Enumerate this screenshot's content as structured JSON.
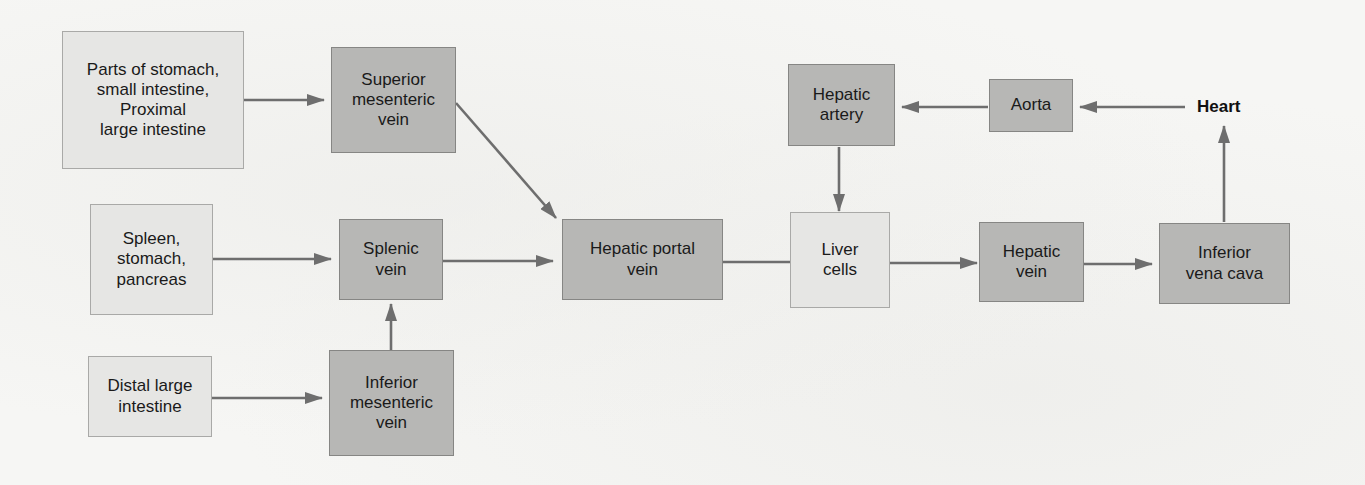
{
  "diagram": {
    "colors": {
      "background": "#f6f6f4",
      "source_box": "#e6e6e4",
      "vessel_box": "#b7b7b5",
      "arrow": "#6e6e6e",
      "text": "#1a1a1a"
    },
    "nodes": {
      "parts_of_stomach": {
        "label": "Parts of stomach,\nsmall intestine,\nProximal\nlarge intestine",
        "style": "light"
      },
      "superior_mesenteric_vein": {
        "label": "Superior\nmesenteric\nvein",
        "style": "dark"
      },
      "spleen_stomach_pancreas": {
        "label": "Spleen,\nstomach,\npancreas",
        "style": "light"
      },
      "splenic_vein": {
        "label": "Splenic\nvein",
        "style": "dark"
      },
      "distal_large_intestine": {
        "label": "Distal large\nintestine",
        "style": "light"
      },
      "inferior_mesenteric_vein": {
        "label": "Inferior\nmesenteric\nvein",
        "style": "dark"
      },
      "hepatic_portal_vein": {
        "label": "Hepatic portal\nvein",
        "style": "dark"
      },
      "liver_cells": {
        "label": "Liver\ncells",
        "style": "light"
      },
      "hepatic_artery": {
        "label": "Hepatic\nartery",
        "style": "dark"
      },
      "aorta": {
        "label": "Aorta",
        "style": "dark"
      },
      "heart": {
        "label": "Heart",
        "style": "plain-bold"
      },
      "hepatic_vein": {
        "label": "Hepatic\nvein",
        "style": "dark"
      },
      "inferior_vena_cava": {
        "label": "Inferior\nvena cava",
        "style": "dark"
      }
    },
    "edges": [
      {
        "from": "Parts of stomach, small intestine, Proximal large intestine",
        "to": "Superior mesenteric vein",
        "arrow": true
      },
      {
        "from": "Superior mesenteric vein",
        "to": "Hepatic portal vein",
        "arrow": true
      },
      {
        "from": "Spleen, stomach, pancreas",
        "to": "Splenic vein",
        "arrow": true
      },
      {
        "from": "Distal large intestine",
        "to": "Inferior mesenteric vein",
        "arrow": true
      },
      {
        "from": "Inferior mesenteric vein",
        "to": "Splenic vein",
        "arrow": true
      },
      {
        "from": "Splenic vein",
        "to": "Hepatic portal vein",
        "arrow": true
      },
      {
        "from": "Hepatic portal vein",
        "to": "Liver cells",
        "arrow": false
      },
      {
        "from": "Heart",
        "to": "Aorta",
        "arrow": true
      },
      {
        "from": "Aorta",
        "to": "Hepatic artery",
        "arrow": true
      },
      {
        "from": "Hepatic artery",
        "to": "Liver cells",
        "arrow": true
      },
      {
        "from": "Liver cells",
        "to": "Hepatic vein",
        "arrow": true
      },
      {
        "from": "Hepatic vein",
        "to": "Inferior vena cava",
        "arrow": true
      },
      {
        "from": "Inferior vena cava",
        "to": "Heart",
        "arrow": true
      }
    ]
  }
}
